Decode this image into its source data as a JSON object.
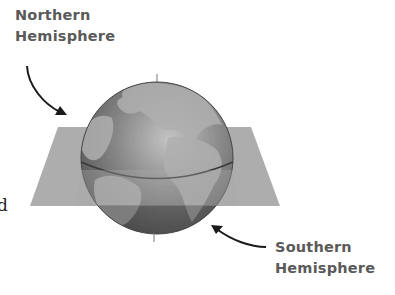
{
  "diagram": {
    "labels": {
      "north_line1": "Northern",
      "north_line2": "Hemisphere",
      "south_line1": "Southern",
      "south_line2": "Hemisphere"
    },
    "edge_text": "d",
    "colors": {
      "label": "#5a5a5a",
      "plane": "#a8a8a8",
      "ocean": "#6e6e6e",
      "land": "#b4b4b4",
      "arrow": "#1a1a1a"
    }
  }
}
